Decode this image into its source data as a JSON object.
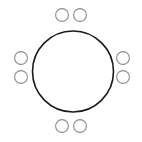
{
  "canvas": {
    "width": 142,
    "height": 142,
    "background_color": "#ffffff",
    "title": "Circle with satellite circles diagram"
  },
  "diagram": {
    "type": "circle-with-satellites",
    "main_circle": {
      "label": "main-circle",
      "center_x": 73,
      "center_y": 71.5,
      "radius": 40.5,
      "stroke_color": "#1a1a1a",
      "stroke_width": 1.6,
      "fill_color": "none"
    },
    "satellite_style": {
      "radius": 6.4,
      "stroke_color": "#8c8c8c",
      "stroke_width": 1.1,
      "fill_color": "#ffffff"
    },
    "satellite_count": 8,
    "satellites": [
      {
        "label": "top-left-satellite",
        "group": "top",
        "center_x": 62,
        "center_y": 15
      },
      {
        "label": "top-right-satellite",
        "group": "top",
        "center_x": 80,
        "center_y": 15
      },
      {
        "label": "left-upper-satellite",
        "group": "left",
        "center_x": 21,
        "center_y": 58
      },
      {
        "label": "left-lower-satellite",
        "group": "left",
        "center_x": 21,
        "center_y": 77
      },
      {
        "label": "right-upper-satellite",
        "group": "right",
        "center_x": 123,
        "center_y": 58
      },
      {
        "label": "right-lower-satellite",
        "group": "right",
        "center_x": 123,
        "center_y": 77
      },
      {
        "label": "bottom-left-satellite",
        "group": "bottom",
        "center_x": 62,
        "center_y": 126
      },
      {
        "label": "bottom-right-satellite",
        "group": "bottom",
        "center_x": 80,
        "center_y": 126
      }
    ]
  }
}
